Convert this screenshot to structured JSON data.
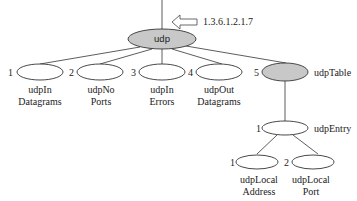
{
  "diagram": {
    "type": "MIB tree",
    "root": {
      "label": "udp",
      "oid": "1.3.6.1.2.1.7",
      "fill": "#c8c8c8"
    },
    "children": [
      {
        "index": "1",
        "line1": "udpIn",
        "line2": "Datagrams",
        "fill": "#ffffff"
      },
      {
        "index": "2",
        "line1": "udpNo",
        "line2": "Ports",
        "fill": "#ffffff"
      },
      {
        "index": "3",
        "line1": "udpIn",
        "line2": "Errors",
        "fill": "#ffffff"
      },
      {
        "index": "4",
        "line1": "udpOut",
        "line2": "Datagrams",
        "fill": "#ffffff"
      },
      {
        "index": "5",
        "label": "udpTable",
        "fill": "#c8c8c8"
      }
    ],
    "entry": {
      "index": "1",
      "label": "udpEntry",
      "fill": "#ffffff"
    },
    "entry_children": [
      {
        "index": "1",
        "line1": "udpLocal",
        "line2": "Address",
        "fill": "#ffffff"
      },
      {
        "index": "2",
        "line1": "udpLocal",
        "line2": "Port",
        "fill": "#ffffff"
      }
    ]
  }
}
